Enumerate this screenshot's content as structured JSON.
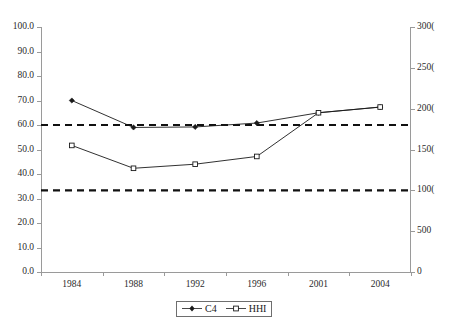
{
  "chart_data": {
    "type": "line",
    "title": "",
    "subtitle": "",
    "xlabel": "",
    "ylabel": "",
    "categories": [
      "1984",
      "1988",
      "1992",
      "1996",
      "2001",
      "2004"
    ],
    "grid": false,
    "legend_position": "bottom-center",
    "axes": {
      "left": {
        "label": "",
        "ylim": [
          0.0,
          100.0
        ],
        "ticks": [
          "0.0",
          "10.0",
          "20.0",
          "30.0",
          "40.0",
          "50.0",
          "60.0",
          "70.0",
          "80.0",
          "90.0",
          "100.0"
        ],
        "tick_values": [
          0,
          10,
          20,
          30,
          40,
          50,
          60,
          70,
          80,
          90,
          100
        ]
      },
      "right": {
        "label": "",
        "ylim": [
          0,
          3000
        ],
        "ticks": [
          "0",
          "500",
          "1000",
          "1500",
          "2000",
          "2500",
          "3000"
        ],
        "ticks_rendered": [
          "0",
          "500",
          "100(",
          "150(",
          "200(",
          "250(",
          "300("
        ],
        "tick_values": [
          0,
          500,
          1000,
          1500,
          2000,
          2500,
          3000
        ],
        "note_clipped": "right tick labels are clipped at the image edge"
      }
    },
    "series": [
      {
        "name": "C4",
        "axis": "left",
        "marker": "filled-diamond",
        "color": "#1a1a1a",
        "values": [
          70.0,
          59.0,
          59.2,
          60.8,
          65.0,
          67.3
        ]
      },
      {
        "name": "HHI",
        "axis": "right",
        "marker": "open-square",
        "color": "#1a1a1a",
        "values": [
          1550,
          1270,
          1320,
          1415,
          1950,
          2020
        ]
      }
    ],
    "reference_lines": [
      {
        "name": "upper-threshold",
        "axis": "right",
        "value": 1800,
        "left_axis_value": 59.5,
        "style": "dashed"
      },
      {
        "name": "lower-threshold",
        "axis": "right",
        "value": 1000,
        "left_axis_value": 33.0,
        "style": "dashed"
      }
    ],
    "legend": [
      {
        "label": "C4",
        "marker": "filled-diamond"
      },
      {
        "label": "HHI",
        "marker": "open-square"
      }
    ]
  }
}
